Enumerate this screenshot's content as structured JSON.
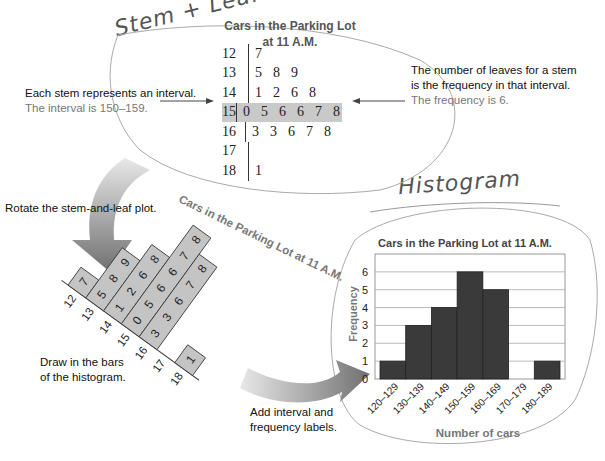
{
  "annotations": {
    "stem_leaf_handwritten": "Stem + Leaf Plot",
    "histogram_handwritten": "Histogram"
  },
  "stem_leaf": {
    "title_line1": "Cars in the Parking Lot",
    "title_line2": "at 11 A.M.",
    "rows": [
      {
        "stem": "12",
        "leaves": [
          "7"
        ]
      },
      {
        "stem": "13",
        "leaves": [
          "5",
          "8",
          "9"
        ]
      },
      {
        "stem": "14",
        "leaves": [
          "1",
          "2",
          "6",
          "8"
        ]
      },
      {
        "stem": "15",
        "leaves": [
          "0",
          "5",
          "6",
          "6",
          "7",
          "8"
        ],
        "highlighted": true
      },
      {
        "stem": "16",
        "leaves": [
          "3",
          "3",
          "6",
          "7",
          "8"
        ]
      },
      {
        "stem": "17",
        "leaves": []
      },
      {
        "stem": "18",
        "leaves": [
          "1"
        ]
      }
    ],
    "highlight_color": "#c9c9c9"
  },
  "callouts": {
    "left_line1": "Each stem represents an interval.",
    "left_line2": "The interval is 150–159.",
    "right_line1": "The number of leaves for a stem",
    "right_line2": "is the frequency in that interval.",
    "right_line3": "The frequency is 6."
  },
  "steps": {
    "rotate": "Rotate the stem-and-leaf plot.",
    "draw_line1": "Draw in the bars",
    "draw_line2": "of the histogram.",
    "add_line1": "Add interval and",
    "add_line2": "frequency labels."
  },
  "rotated_plot": {
    "title": "Cars in the Parking Lot at 11 A.M.",
    "bar_color": "#c4c4c4",
    "columns": [
      {
        "stem": "12",
        "leaves": [
          "7"
        ]
      },
      {
        "stem": "13",
        "leaves": [
          "5",
          "8",
          "9"
        ]
      },
      {
        "stem": "14",
        "leaves": [
          "1",
          "2",
          "6",
          "8"
        ]
      },
      {
        "stem": "15",
        "leaves": [
          "0",
          "5",
          "6",
          "6",
          "7",
          "8"
        ]
      },
      {
        "stem": "16",
        "leaves": [
          "3",
          "3",
          "6",
          "7",
          "8"
        ]
      },
      {
        "stem": "17",
        "leaves": []
      },
      {
        "stem": "18",
        "leaves": [
          "1"
        ]
      }
    ]
  },
  "chart_data": {
    "type": "bar",
    "title": "Cars in the Parking Lot at 11 A.M.",
    "xlabel": "Number of cars",
    "ylabel": "Frequency",
    "categories": [
      "120–129",
      "130–139",
      "140–149",
      "150–159",
      "160–169",
      "170–179",
      "180–189"
    ],
    "values": [
      1,
      3,
      4,
      6,
      5,
      0,
      1
    ],
    "ylim": [
      0,
      7
    ],
    "yticks": [
      0,
      1,
      2,
      3,
      4,
      5,
      6
    ],
    "grid": true,
    "bar_color": "#3a3a3a"
  }
}
